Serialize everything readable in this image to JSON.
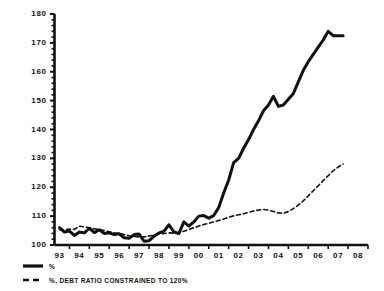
{
  "chart_data": {
    "type": "line",
    "title": "",
    "subtitle": "",
    "xlabel": "",
    "ylabel": "",
    "ylim": [
      100,
      180
    ],
    "xlim": [
      1992.75,
      2008.5
    ],
    "grid": false,
    "y_ticks": [
      100,
      110,
      120,
      130,
      140,
      150,
      160,
      170,
      180
    ],
    "y_tick_labels": [
      "100",
      "110",
      "120",
      "130",
      "140",
      "150",
      "160",
      "170",
      "180"
    ],
    "y_minor_tick_step": 2,
    "x_ticks": [
      1993,
      1994,
      1995,
      1996,
      1997,
      1998,
      1999,
      2000,
      2001,
      2002,
      2003,
      2004,
      2005,
      2006,
      2007,
      2008
    ],
    "x_tick_labels": [
      "93",
      "94",
      "95",
      "96",
      "97",
      "98",
      "99",
      "00",
      "01",
      "02",
      "03",
      "04",
      "05",
      "06",
      "07",
      "08"
    ],
    "legend_position": "below-left",
    "series": [
      {
        "name": "%",
        "style": "solid",
        "color": "#111111",
        "line_width": 3,
        "x": [
          1993.0,
          1993.25,
          1993.5,
          1993.75,
          1994.0,
          1994.25,
          1994.5,
          1994.75,
          1995.0,
          1995.25,
          1995.5,
          1995.75,
          1996.0,
          1996.25,
          1996.5,
          1996.75,
          1997.0,
          1997.25,
          1997.5,
          1997.75,
          1998.0,
          1998.25,
          1998.5,
          1998.75,
          1999.0,
          1999.25,
          1999.5,
          1999.75,
          2000.0,
          2000.25,
          2000.5,
          2000.75,
          2001.0,
          2001.25,
          2001.5,
          2001.75,
          2002.0,
          2002.25,
          2002.5,
          2002.75,
          2003.0,
          2003.25,
          2003.5,
          2003.75,
          2004.0,
          2004.25,
          2004.5,
          2004.75,
          2005.0,
          2005.25,
          2005.5,
          2005.75,
          2006.0,
          2006.25,
          2006.5,
          2006.75,
          2007.0,
          2007.25
        ],
        "values": [
          106.0,
          104.5,
          104.8,
          103.3,
          104.5,
          104.2,
          105.8,
          104.3,
          105.3,
          104.0,
          104.2,
          103.6,
          103.9,
          102.5,
          102.3,
          103.6,
          103.8,
          101.3,
          101.5,
          103.0,
          104.2,
          104.8,
          107.0,
          104.5,
          104.0,
          108.0,
          106.5,
          108.0,
          110.0,
          110.2,
          109.3,
          110.2,
          113.0,
          118.0,
          122.5,
          128.5,
          130.0,
          133.5,
          136.5,
          140.0,
          143.0,
          146.5,
          148.5,
          151.5,
          148.0,
          148.5,
          150.5,
          152.5,
          156.5,
          160.5,
          163.5,
          166.0,
          168.5,
          171.0,
          174.0,
          172.5,
          172.5,
          172.5
        ]
      },
      {
        "name": "%, DEBT RATIO CONSTRAINED TO 120%",
        "style": "dashed",
        "color": "#111111",
        "line_width": 1.6,
        "x": [
          1993.0,
          1993.25,
          1993.5,
          1993.75,
          1994.0,
          1994.25,
          1994.5,
          1994.75,
          1995.0,
          1995.25,
          1995.5,
          1995.75,
          1996.0,
          1996.25,
          1996.5,
          1996.75,
          1997.0,
          1997.25,
          1997.5,
          1997.75,
          1998.0,
          1998.25,
          1998.5,
          1998.75,
          1999.0,
          1999.25,
          1999.5,
          1999.75,
          2000.0,
          2000.25,
          2000.5,
          2000.75,
          2001.0,
          2001.25,
          2001.5,
          2001.75,
          2002.0,
          2002.25,
          2002.5,
          2002.75,
          2003.0,
          2003.25,
          2003.5,
          2003.75,
          2004.0,
          2004.25,
          2004.5,
          2004.75,
          2005.0,
          2005.25,
          2005.5,
          2005.75,
          2006.0,
          2006.25,
          2006.5,
          2006.75,
          2007.0,
          2007.25
        ],
        "values": [
          105.3,
          105.3,
          105.5,
          105.4,
          106.5,
          106.3,
          106.0,
          105.6,
          105.3,
          105.0,
          104.6,
          104.2,
          104.0,
          103.6,
          103.2,
          103.0,
          102.8,
          102.8,
          103.1,
          103.4,
          103.8,
          104.0,
          104.2,
          104.1,
          104.2,
          104.8,
          105.4,
          106.0,
          106.6,
          107.1,
          107.5,
          108.0,
          108.5,
          109.0,
          109.6,
          110.1,
          110.5,
          110.8,
          111.3,
          111.8,
          112.1,
          112.3,
          112.1,
          111.6,
          111.1,
          111.0,
          111.6,
          112.6,
          113.8,
          115.3,
          117.0,
          118.8,
          120.5,
          122.3,
          124.0,
          125.7,
          127.0,
          128.0
        ]
      }
    ]
  },
  "legend": {
    "items": [
      {
        "label": "%",
        "style": "solid"
      },
      {
        "label": "%, DEBT RATIO CONSTRAINED TO 120%",
        "style": "dashed"
      }
    ]
  },
  "axes": {
    "y_axis_name": "y-axis",
    "x_axis_name": "x-axis"
  }
}
